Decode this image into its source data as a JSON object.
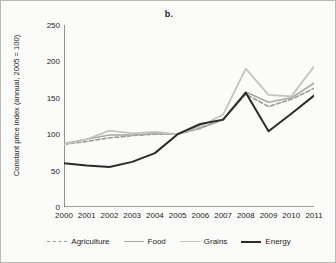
{
  "chart_data": {
    "type": "line",
    "title": "b.",
    "xlabel": "",
    "ylabel": "Constant price index (annual, 2005 = 100)",
    "x": [
      2000,
      2001,
      2002,
      2003,
      2004,
      2005,
      2006,
      2007,
      2008,
      2009,
      2010,
      2011
    ],
    "xtick_labels": [
      "2000",
      "2001",
      "2002",
      "2003",
      "2004",
      "2005",
      "2006",
      "2007",
      "2008",
      "2009",
      "2010",
      "2011"
    ],
    "ytick_labels": [
      "0",
      "50",
      "100",
      "150",
      "200",
      "250"
    ],
    "yticks": [
      0,
      50,
      100,
      150,
      200,
      250
    ],
    "xlim": [
      2000,
      2011
    ],
    "ylim": [
      0,
      250
    ],
    "grid": false,
    "legend_position": "bottom",
    "series": [
      {
        "name": "Agriculture",
        "color": "#9b9b99",
        "style": "dashed",
        "width": 1.6,
        "values": [
          86,
          90,
          95,
          98,
          100,
          100,
          108,
          120,
          155,
          138,
          148,
          163
        ]
      },
      {
        "name": "Food",
        "color": "#a8a8a6",
        "style": "solid",
        "width": 1.6,
        "values": [
          87,
          93,
          99,
          99,
          101,
          100,
          109,
          120,
          158,
          144,
          150,
          170
        ]
      },
      {
        "name": "Grains",
        "color": "#c3c3c1",
        "style": "solid",
        "width": 1.8,
        "values": [
          86,
          93,
          105,
          101,
          103,
          100,
          111,
          127,
          190,
          154,
          152,
          193
        ]
      },
      {
        "name": "Energy",
        "color": "#2b2b2b",
        "style": "solid",
        "width": 2.0,
        "values": [
          60,
          57,
          55,
          62,
          74,
          100,
          114,
          120,
          157,
          104,
          128,
          153
        ]
      }
    ]
  },
  "legend": {
    "items": [
      {
        "label": "Agriculture"
      },
      {
        "label": "Food"
      },
      {
        "label": "Grains"
      },
      {
        "label": "Energy"
      }
    ]
  }
}
